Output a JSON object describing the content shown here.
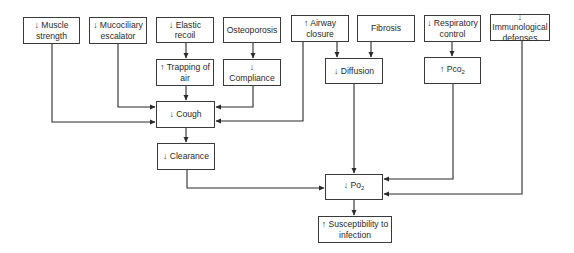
{
  "diagram": {
    "nodes": {
      "muscle_strength": {
        "label": "↓ Muscle strength"
      },
      "mucociliary": {
        "label": "↓ Mucociliary escalator"
      },
      "elastic_recoil": {
        "label": "↓ Elastic recoil"
      },
      "osteoporosis": {
        "label": "Osteoporosis"
      },
      "airway_closure": {
        "label": "↑ Airway closure"
      },
      "fibrosis": {
        "label": "Fibrosis"
      },
      "respiratory_control": {
        "label": "↓ Respiratory control"
      },
      "immunological": {
        "label": "↓ Immunological defenses"
      },
      "trapping_air": {
        "label": "↑ Trapping of air"
      },
      "compliance": {
        "label": "↓ Compliance"
      },
      "diffusion": {
        "label": "↓ Diffusion"
      },
      "pco2": {
        "label": "↑ Pco",
        "sub": "2"
      },
      "cough": {
        "label": "↓ Cough"
      },
      "clearance": {
        "label": "↓ Clearance"
      },
      "po2": {
        "label": "↓ Po",
        "sub": "2"
      },
      "susceptibility": {
        "label": "↑ Susceptibility to infection"
      }
    },
    "edges": [
      {
        "from": "muscle_strength",
        "to": "cough"
      },
      {
        "from": "mucociliary",
        "to": "cough"
      },
      {
        "from": "elastic_recoil",
        "to": "trapping_air"
      },
      {
        "from": "trapping_air",
        "to": "cough"
      },
      {
        "from": "osteoporosis",
        "to": "compliance"
      },
      {
        "from": "compliance",
        "to": "cough"
      },
      {
        "from": "airway_closure",
        "to": "cough"
      },
      {
        "from": "airway_closure",
        "to": "diffusion"
      },
      {
        "from": "fibrosis",
        "to": "diffusion"
      },
      {
        "from": "respiratory_control",
        "to": "pco2"
      },
      {
        "from": "cough",
        "to": "clearance"
      },
      {
        "from": "clearance",
        "to": "po2"
      },
      {
        "from": "diffusion",
        "to": "po2"
      },
      {
        "from": "pco2",
        "to": "po2"
      },
      {
        "from": "immunological",
        "to": "po2"
      },
      {
        "from": "po2",
        "to": "susceptibility"
      }
    ]
  }
}
